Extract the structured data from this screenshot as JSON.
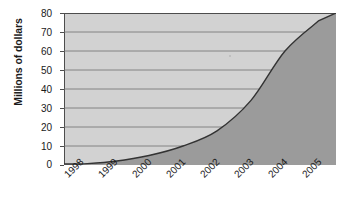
{
  "chart_data": {
    "type": "area",
    "title": "",
    "subtitle": "",
    "xlabel": "",
    "ylabel": "Millions of dollars",
    "categories": [
      "1998",
      "1999",
      "2000",
      "2001",
      "2002",
      "2003",
      "2004",
      "2005"
    ],
    "values": [
      0.5,
      2,
      5,
      10,
      18,
      34,
      60,
      76
    ],
    "series": [
      {
        "name": "Revenue",
        "values": [
          0.5,
          2,
          5,
          10,
          18,
          34,
          60,
          76
        ]
      }
    ],
    "ylim": [
      0,
      80
    ],
    "y_ticks": [
      0,
      10,
      20,
      30,
      40,
      50,
      60,
      70,
      80
    ],
    "y_tick_labels": [
      "0",
      "10",
      "20",
      "30",
      "40",
      "50",
      "60",
      "70",
      "80"
    ],
    "grid": "horizontal",
    "legend": "none",
    "area_fill_color": "#9b9b9b",
    "plot_background_color": "#d2d2d2",
    "line_color": "#333333",
    "gridline_color": "#6e6e6e",
    "axis_color": "#4d4d4d",
    "x_tick_label_rotation": "-45"
  },
  "axes": {
    "y_title": "Millions of dollars"
  }
}
